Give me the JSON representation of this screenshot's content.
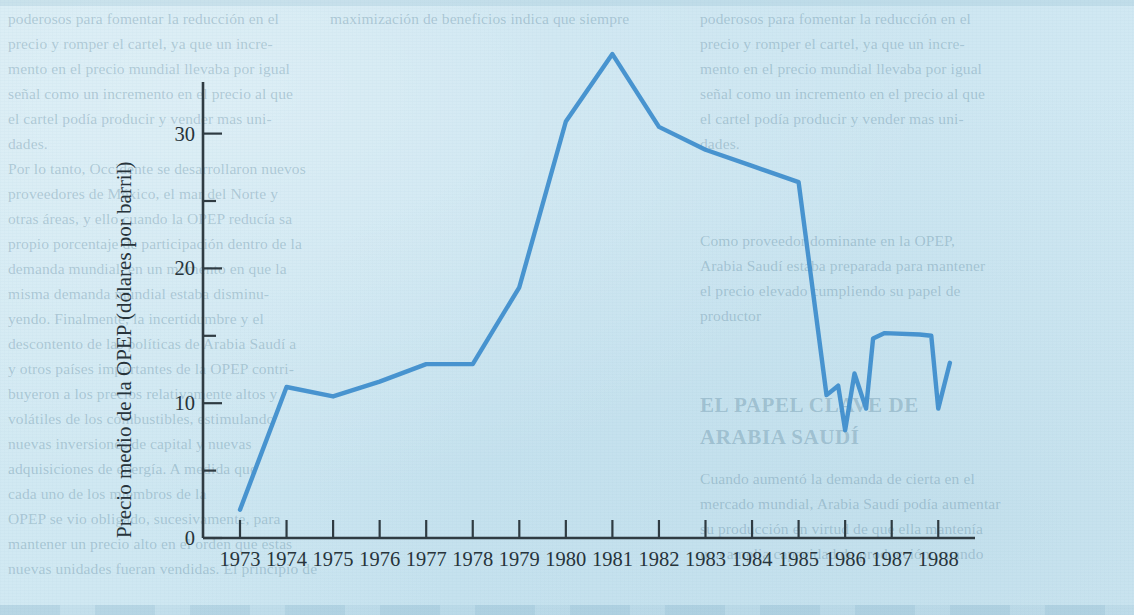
{
  "figure": {
    "y_axis_title": "Precio medio de la OPEP (dólares por barril)",
    "x_tick_labels": [
      "1973",
      "1974",
      "1975",
      "1976",
      "1977",
      "1978",
      "1979",
      "1980",
      "1981",
      "1982",
      "1983",
      "1984",
      "1985",
      "1986",
      "1987",
      "1988"
    ],
    "y_tick_labels": [
      "0",
      "10",
      "20",
      "30"
    ],
    "line_color": "#3d8dcc",
    "axis_color": "#2f3b42",
    "background_color": "#cde7f1"
  },
  "chart_data": {
    "type": "line",
    "title": "",
    "xlabel": "",
    "ylabel": "Precio medio de la OPEP (dólares por barril)",
    "xlim": [
      1972.6,
      1988.8
    ],
    "ylim": [
      0,
      38
    ],
    "yticks": [
      0,
      10,
      20,
      30
    ],
    "yticks_minor": [
      5,
      15,
      25,
      35
    ],
    "xticks": [
      1973,
      1974,
      1975,
      1976,
      1977,
      1978,
      1979,
      1980,
      1981,
      1982,
      1983,
      1984,
      1985,
      1986,
      1987,
      1988
    ],
    "grid": false,
    "legend": "none",
    "x": [
      1973,
      1974,
      1975,
      1976,
      1977,
      1978,
      1979,
      1980,
      1981,
      1982,
      1983,
      1984,
      1985,
      1985.6,
      1985.85,
      1986.0,
      1986.2,
      1986.45,
      1986.6,
      1986.85,
      1987.6,
      1987.85,
      1988.0,
      1988.25
    ],
    "values": [
      2.1,
      11.2,
      10.5,
      11.6,
      12.9,
      12.9,
      18.6,
      30.9,
      35.9,
      30.5,
      28.8,
      27.6,
      26.4,
      10.6,
      11.3,
      8.0,
      12.2,
      9.6,
      14.8,
      15.2,
      15.1,
      15.0,
      9.6,
      13.0
    ],
    "series": [
      {
        "name": "Precio medio de la OPEP",
        "points": [
          {
            "x": "1973",
            "y": 2.1
          },
          {
            "x": "1974",
            "y": 11.2
          },
          {
            "x": "1975",
            "y": 10.5
          },
          {
            "x": "1976",
            "y": 11.6
          },
          {
            "x": "1977",
            "y": 12.9
          },
          {
            "x": "1978",
            "y": 12.9
          },
          {
            "x": "1979",
            "y": 18.6
          },
          {
            "x": "1980",
            "y": 30.9
          },
          {
            "x": "1981",
            "y": 35.9
          },
          {
            "x": "1982",
            "y": 30.5
          },
          {
            "x": "1983",
            "y": 28.8
          },
          {
            "x": "1984",
            "y": 27.6
          },
          {
            "x": "1985",
            "y": 26.4
          },
          {
            "x": "1985.6",
            "y": 10.6
          },
          {
            "x": "1985.85",
            "y": 11.3
          },
          {
            "x": "1986.0",
            "y": 8.0
          },
          {
            "x": "1986.2",
            "y": 12.2
          },
          {
            "x": "1986.45",
            "y": 9.6
          },
          {
            "x": "1986.6",
            "y": 14.8
          },
          {
            "x": "1986.85",
            "y": 15.2
          },
          {
            "x": "1987.6",
            "y": 15.1
          },
          {
            "x": "1987.85",
            "y": 15.0
          },
          {
            "x": "1988.0",
            "y": 9.6
          },
          {
            "x": "1988.25",
            "y": 13.0
          }
        ]
      }
    ]
  },
  "page_bleed": {
    "col1": [
      "poderosos para fomentar la reducción en el",
      "precio y romper el cartel, ya que un incre-",
      "mento en el precio mundial llevaba por igual",
      "señal como un incremento en el precio al que",
      "el cartel podía producir y vender mas uni-",
      "dades."
    ],
    "col1b": [
      "Por lo tanto, Occidente se desarrollaron nuevos",
      "proveedores de México, el mar del Norte y",
      "otras áreas, y ello cuando la OPEP reducía sa",
      "propio porcentaje de participación dentro de la",
      "demanda mundial, en un momento en que la",
      "misma demanda mundial estaba disminu-",
      "yendo. Finalmente, la incertidumbre y el",
      "descontento de las políticas de Arabia Saudí a",
      "y otros países importantes de la OPEP contri-",
      "buyeron a los precios relativamente altos y",
      "volátiles de los combustibles, estimulando",
      "nuevas inversiones de capital y nuevas",
      "adquisiciones de energía. A medida que",
      "cada uno de los miembros de la",
      "OPEP se vio obligado, sucesivamente, para",
      "mantener un precio alto en el orden que estas",
      "nuevas unidades fueran vendidas. El principio de",
      "maximización de beneficios indica que siempre"
    ],
    "col3": [
      "Como proveedor dominante en la OPEP,",
      "Arabia Saudí estaba preparada para mantener",
      "el precio elevado cumpliendo su papel de",
      "productor"
    ],
    "heading": [
      "EL PAPEL CLAVE DE",
      "ARABIA SAUDÍ"
    ],
    "col2": [
      "Cuando aumentó la demanda de cierta en el",
      "mercado mundial, Arabia Saudí podía aumentar",
      "su producción en virtud de que ella mantenía",
      "una amplia capacidad de producción; cuando"
    ]
  }
}
